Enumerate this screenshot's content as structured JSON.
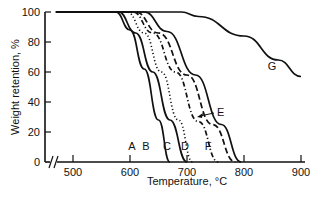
{
  "chart_data": {
    "type": "line",
    "title": "",
    "xlabel": "Temperature, °C",
    "ylabel": "Weight retention, %",
    "xlim": [
      470,
      900
    ],
    "ylim": [
      0,
      100
    ],
    "x_ticks": [
      500,
      600,
      700,
      800,
      900
    ],
    "y_ticks": [
      0,
      20,
      40,
      60,
      80,
      100
    ],
    "axis_break": "x-axis broken near origin",
    "grid": false,
    "legend": "inline curve labels",
    "series": [
      {
        "name": "A",
        "style": "solid",
        "x": [
          470,
          575,
          600,
          625,
          650,
          670
        ],
        "y": [
          100,
          100,
          88,
          62,
          28,
          0
        ]
      },
      {
        "name": "B",
        "style": "solid",
        "x": [
          470,
          580,
          610,
          640,
          670,
          700
        ],
        "y": [
          100,
          100,
          86,
          60,
          28,
          0
        ]
      },
      {
        "name": "C",
        "style": "dotted",
        "x": [
          470,
          595,
          625,
          655,
          685,
          710
        ],
        "y": [
          100,
          100,
          86,
          60,
          28,
          0
        ]
      },
      {
        "name": "D",
        "style": "dash-dot",
        "x": [
          470,
          605,
          640,
          680,
          720,
          755
        ],
        "y": [
          100,
          100,
          86,
          60,
          27,
          0
        ]
      },
      {
        "name": "E",
        "style": "dashed",
        "x": [
          470,
          610,
          650,
          700,
          745,
          785
        ],
        "y": [
          100,
          100,
          86,
          58,
          25,
          0
        ]
      },
      {
        "name": "F",
        "style": "solid",
        "x": [
          470,
          625,
          665,
          715,
          760,
          795
        ],
        "y": [
          100,
          100,
          87,
          58,
          25,
          0
        ]
      },
      {
        "name": "G",
        "style": "solid",
        "x": [
          470,
          690,
          720,
          800,
          860,
          900
        ],
        "y": [
          100,
          100,
          97,
          84,
          68,
          57
        ]
      }
    ]
  },
  "labels": {
    "A": "A",
    "B": "B",
    "C": "C",
    "D": "D",
    "E": "E",
    "F": "F",
    "G": "G"
  }
}
